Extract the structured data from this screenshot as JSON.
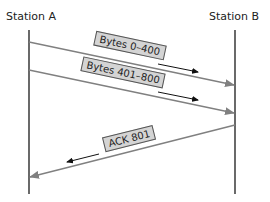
{
  "diagram": {
    "title": "",
    "type": "sequence",
    "colors": {
      "lifeline": "#444444",
      "message_line": "#808080",
      "direction_arrow": "#111111",
      "label_bg": "#d4d4d4",
      "label_border": "#555555"
    },
    "stations": [
      {
        "id": "A",
        "label": "Station A",
        "x": 29
      },
      {
        "id": "B",
        "label": "Station B",
        "x": 235
      }
    ],
    "messages": [
      {
        "label": "Bytes 0–400",
        "from": "A",
        "to": "B",
        "y_start": 42,
        "y_end": 85,
        "label_x": 125,
        "label_y": 46,
        "angle": 12
      },
      {
        "label": "Bytes 401–800",
        "from": "A",
        "to": "B",
        "y_start": 70,
        "y_end": 113,
        "label_x": 119,
        "label_y": 74,
        "angle": 12
      },
      {
        "label": "ACK 801",
        "from": "B",
        "to": "A",
        "y_start": 125,
        "y_end": 177,
        "label_x": 124,
        "label_y": 139,
        "angle": -14
      }
    ]
  }
}
